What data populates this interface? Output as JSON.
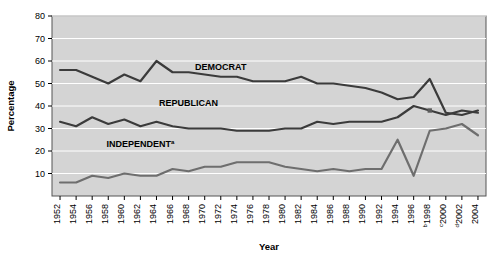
{
  "chart_data": {
    "type": "line",
    "title": "",
    "xlabel": "Year",
    "ylabel": "Percentage",
    "ylim": [
      0,
      80
    ],
    "yticks": [
      10,
      20,
      30,
      40,
      50,
      60,
      70,
      80
    ],
    "grid": true,
    "grid_color": "#ffffff",
    "plot_bg": "#d4d4d4",
    "legend": "inline-labels",
    "x": [
      1952,
      1954,
      1956,
      1958,
      1960,
      1962,
      1964,
      1966,
      1968,
      1970,
      1972,
      1974,
      1976,
      1978,
      1980,
      1982,
      1984,
      1986,
      1988,
      1990,
      1992,
      1994,
      1996,
      1998,
      2000,
      2002,
      2004
    ],
    "xtick_labels": [
      "1952",
      "1954",
      "1956",
      "1958",
      "1960",
      "1962",
      "1964",
      "1966",
      "1968",
      "1970",
      "1972",
      "1974",
      "1976",
      "1978",
      "1980",
      "1982",
      "1984",
      "1986",
      "1988",
      "1990",
      "1992",
      "1994",
      "1996",
      "1998",
      "2000",
      "2002",
      "2004"
    ],
    "xtick_superscripts": [
      "",
      "",
      "",
      "",
      "",
      "",
      "",
      "",
      "",
      "",
      "",
      "",
      "",
      "",
      "",
      "",
      "",
      "",
      "",
      "",
      "",
      "",
      "",
      "b",
      "c",
      "d",
      ""
    ],
    "series": [
      {
        "name": "DEMOCRAT",
        "label": "DEMOCRAT",
        "color": "#3b3b3b",
        "values": [
          56,
          56,
          53,
          50,
          54,
          51,
          60,
          55,
          55,
          54,
          53,
          53,
          51,
          51,
          51,
          53,
          50,
          50,
          49,
          48,
          46,
          43,
          44,
          52,
          37,
          36,
          38
        ]
      },
      {
        "name": "REPUBLICAN",
        "label": "REPUBLICAN",
        "color": "#3b3b3b",
        "values": [
          33,
          31,
          35,
          32,
          34,
          31,
          33,
          31,
          30,
          30,
          30,
          29,
          29,
          29,
          30,
          30,
          33,
          32,
          33,
          33,
          33,
          35,
          40,
          38,
          36,
          38,
          37
        ]
      },
      {
        "name": "INDEPENDENT",
        "label": "INDEPENDENT",
        "superscript": "a",
        "color": "#6e6e6e",
        "values": [
          6,
          6,
          9,
          8,
          10,
          9,
          9,
          12,
          11,
          13,
          13,
          15,
          15,
          15,
          13,
          12,
          11,
          12,
          11,
          12,
          12,
          25,
          9,
          29,
          30,
          32,
          27
        ]
      }
    ],
    "series_label_positions": [
      {
        "series": "DEMOCRAT",
        "x": 1972,
        "y": 56
      },
      {
        "series": "REPUBLICAN",
        "x": 1968,
        "y": 40
      },
      {
        "series": "INDEPENDENT",
        "x": 1962,
        "y": 22
      }
    ],
    "marker": {
      "x": 1998,
      "y": 38,
      "color": "#5a5a5a"
    }
  }
}
